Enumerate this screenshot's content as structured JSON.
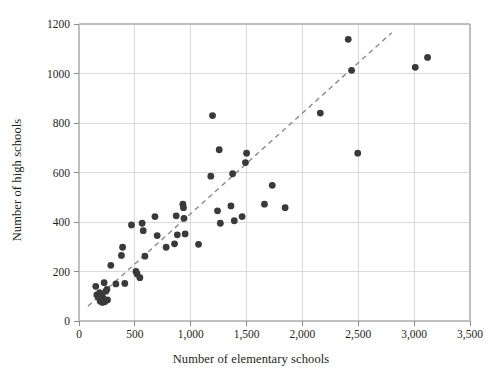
{
  "chart_data": {
    "type": "scatter",
    "title": "",
    "xlabel": "Number of elementary schools",
    "ylabel": "Number of high schools",
    "xlim": [
      0,
      3500
    ],
    "ylim": [
      0,
      1200
    ],
    "xticks": [
      0,
      500,
      1000,
      1500,
      2000,
      2500,
      3000,
      3500
    ],
    "xtick_labels": [
      "0",
      "500",
      "1,000",
      "1,500",
      "2,000",
      "2,500",
      "3,000",
      "3,500"
    ],
    "yticks": [
      0,
      200,
      400,
      600,
      800,
      1000,
      1200
    ],
    "ytick_labels": [
      "0",
      "200",
      "400",
      "600",
      "800",
      "1000",
      "1200"
    ],
    "grid": true,
    "legend": false,
    "marker_color": "#3a3a3a",
    "grid_color": "#d9d9d9",
    "frame_color": "#bfbfbf",
    "trendline": {
      "style": "dashed",
      "color": "#8b8b8b",
      "x": [
        80,
        2800
      ],
      "y": [
        60,
        1165
      ]
    },
    "points": [
      {
        "x": 150,
        "y": 140
      },
      {
        "x": 160,
        "y": 105
      },
      {
        "x": 175,
        "y": 95
      },
      {
        "x": 185,
        "y": 115
      },
      {
        "x": 190,
        "y": 80
      },
      {
        "x": 200,
        "y": 88
      },
      {
        "x": 205,
        "y": 100
      },
      {
        "x": 210,
        "y": 75
      },
      {
        "x": 215,
        "y": 92
      },
      {
        "x": 225,
        "y": 155
      },
      {
        "x": 230,
        "y": 78
      },
      {
        "x": 240,
        "y": 120
      },
      {
        "x": 250,
        "y": 128
      },
      {
        "x": 255,
        "y": 85
      },
      {
        "x": 285,
        "y": 225
      },
      {
        "x": 330,
        "y": 150
      },
      {
        "x": 380,
        "y": 265
      },
      {
        "x": 390,
        "y": 298
      },
      {
        "x": 410,
        "y": 152
      },
      {
        "x": 470,
        "y": 388
      },
      {
        "x": 510,
        "y": 200
      },
      {
        "x": 520,
        "y": 190
      },
      {
        "x": 545,
        "y": 175
      },
      {
        "x": 565,
        "y": 395
      },
      {
        "x": 575,
        "y": 365
      },
      {
        "x": 590,
        "y": 262
      },
      {
        "x": 680,
        "y": 422
      },
      {
        "x": 700,
        "y": 345
      },
      {
        "x": 780,
        "y": 298
      },
      {
        "x": 855,
        "y": 312
      },
      {
        "x": 870,
        "y": 425
      },
      {
        "x": 880,
        "y": 348
      },
      {
        "x": 930,
        "y": 472
      },
      {
        "x": 935,
        "y": 458
      },
      {
        "x": 940,
        "y": 415
      },
      {
        "x": 950,
        "y": 352
      },
      {
        "x": 1070,
        "y": 310
      },
      {
        "x": 1180,
        "y": 585
      },
      {
        "x": 1195,
        "y": 830
      },
      {
        "x": 1240,
        "y": 445
      },
      {
        "x": 1255,
        "y": 692
      },
      {
        "x": 1265,
        "y": 395
      },
      {
        "x": 1360,
        "y": 465
      },
      {
        "x": 1375,
        "y": 595
      },
      {
        "x": 1390,
        "y": 405
      },
      {
        "x": 1460,
        "y": 422
      },
      {
        "x": 1490,
        "y": 640
      },
      {
        "x": 1500,
        "y": 678
      },
      {
        "x": 1660,
        "y": 472
      },
      {
        "x": 1730,
        "y": 548
      },
      {
        "x": 1845,
        "y": 458
      },
      {
        "x": 2160,
        "y": 840
      },
      {
        "x": 2410,
        "y": 1138
      },
      {
        "x": 2440,
        "y": 1013
      },
      {
        "x": 2495,
        "y": 678
      },
      {
        "x": 3010,
        "y": 1025
      },
      {
        "x": 3120,
        "y": 1065
      }
    ]
  }
}
